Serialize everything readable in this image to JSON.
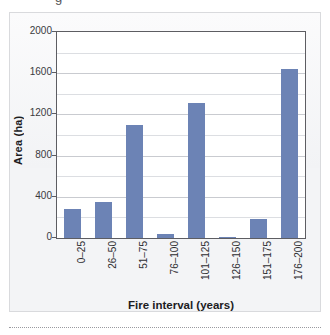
{
  "figure": {
    "top_crop_glyph": "g",
    "panel_background": "#f3f4f6",
    "bar_color": "#6c83b5",
    "frame_color": "#5d5d62",
    "gridline_color": "#c9cbd0"
  },
  "chart_data": {
    "type": "bar",
    "title": "",
    "xlabel": "Fire interval (years)",
    "ylabel": "Area (ha)",
    "categories": [
      "0–25",
      "26–50",
      "51–75",
      "76–100",
      "101–125",
      "126–150",
      "151–175",
      "176–200"
    ],
    "values": [
      280,
      350,
      1100,
      35,
      1310,
      10,
      180,
      1640
    ],
    "ylim": [
      0,
      2000
    ],
    "ytick_labels": [
      "2000",
      "1600",
      "1200",
      "800",
      "400",
      "0"
    ],
    "ytick_values": [
      2000,
      1600,
      1200,
      800,
      400,
      0
    ],
    "minor_gridline_values": [
      1800,
      1400,
      1000,
      600,
      200
    ],
    "grid": true,
    "legend": false,
    "legend_position": "none"
  }
}
